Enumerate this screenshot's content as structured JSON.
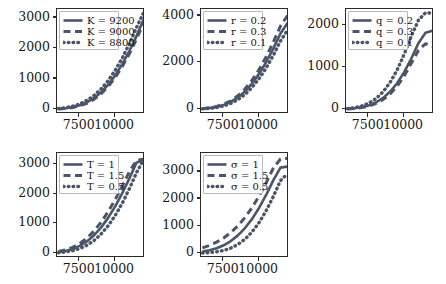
{
  "figure": {
    "background_color": "#ffffff",
    "line_color": "#4a5568",
    "axis_color": "#2a2a2a",
    "legend_border_color": "#b8b8c8",
    "rows": 2,
    "cols": 3
  },
  "chart_data": [
    {
      "type": "line",
      "title": "",
      "xlabel": "",
      "ylabel": "",
      "x": [
        6000,
        6500,
        7000,
        7500,
        8000,
        8500,
        9000,
        9500,
        10000,
        10500,
        11000,
        11500,
        12000
      ],
      "xlim": [
        5900,
        12100
      ],
      "ylim": [
        -150,
        3300
      ],
      "xticks": [
        7500,
        10000
      ],
      "xtick_labels": [
        "7500",
        "10000"
      ],
      "yticks": [
        0,
        1000,
        2000,
        3000
      ],
      "ytick_labels": [
        "0",
        "1000",
        "2000",
        "3000"
      ],
      "grid": false,
      "legend_position": "upper left",
      "series": [
        {
          "name": "K = 9200",
          "style": "solid",
          "values": [
            20,
            40,
            75,
            135,
            230,
            370,
            560,
            810,
            1120,
            1490,
            1920,
            2410,
            2950
          ]
        },
        {
          "name": "K = 9000",
          "style": "dashed",
          "values": [
            15,
            32,
            62,
            115,
            200,
            330,
            510,
            750,
            1050,
            1410,
            1830,
            2310,
            2840
          ]
        },
        {
          "name": "K = 8800",
          "style": "dotted",
          "values": [
            30,
            58,
            105,
            180,
            295,
            455,
            670,
            945,
            1285,
            1690,
            2160,
            2690,
            3180
          ]
        }
      ]
    },
    {
      "type": "line",
      "title": "",
      "xlabel": "",
      "ylabel": "",
      "x": [
        6000,
        6500,
        7000,
        7500,
        8000,
        8500,
        9000,
        9500,
        10000,
        10500,
        11000,
        11500,
        12000
      ],
      "xlim": [
        5900,
        12100
      ],
      "ylim": [
        -200,
        4300
      ],
      "xticks": [
        7500,
        10000
      ],
      "xtick_labels": [
        "7500",
        "10000"
      ],
      "yticks": [
        0,
        2000,
        4000
      ],
      "ytick_labels": [
        "0",
        "2000",
        "4000"
      ],
      "grid": false,
      "legend_position": "upper left",
      "series": [
        {
          "name": "r = 0.2",
          "style": "solid",
          "values": [
            25,
            55,
            105,
            190,
            320,
            510,
            770,
            1110,
            1530,
            2030,
            2610,
            3250,
            3700
          ]
        },
        {
          "name": "r = 0.3",
          "style": "dashed",
          "values": [
            30,
            65,
            125,
            220,
            365,
            580,
            870,
            1250,
            1710,
            2260,
            2890,
            3570,
            4020
          ]
        },
        {
          "name": "r = 0.1",
          "style": "dotted",
          "values": [
            18,
            40,
            80,
            148,
            255,
            415,
            640,
            940,
            1320,
            1780,
            2320,
            2930,
            3400
          ]
        }
      ]
    },
    {
      "type": "line",
      "title": "",
      "xlabel": "",
      "ylabel": "",
      "x": [
        6000,
        6500,
        7000,
        7500,
        8000,
        8500,
        9000,
        9500,
        10000,
        10500,
        11000,
        11500,
        12000
      ],
      "xlim": [
        5900,
        12100
      ],
      "ylim": [
        -110,
        2400
      ],
      "xticks": [
        7500,
        10000
      ],
      "xtick_labels": [
        "7500",
        "10000"
      ],
      "yticks": [
        0,
        1000,
        2000
      ],
      "ytick_labels": [
        "0",
        "1000",
        "2000"
      ],
      "grid": false,
      "legend_position": "upper left",
      "series": [
        {
          "name": "q = 0.2",
          "style": "solid",
          "values": [
            12,
            26,
            52,
            95,
            165,
            270,
            420,
            625,
            890,
            1215,
            1580,
            1830,
            1880
          ]
        },
        {
          "name": "q = 0.3",
          "style": "dashed",
          "values": [
            10,
            22,
            44,
            80,
            140,
            232,
            366,
            552,
            800,
            1105,
            1410,
            1570,
            1510
          ]
        },
        {
          "name": "q = 0.1",
          "style": "dotted",
          "values": [
            18,
            40,
            80,
            148,
            255,
            415,
            640,
            940,
            1320,
            1750,
            2130,
            2310,
            2300
          ]
        }
      ]
    },
    {
      "type": "line",
      "title": "",
      "xlabel": "",
      "ylabel": "",
      "x": [
        6000,
        6500,
        7000,
        7500,
        8000,
        8500,
        9000,
        9500,
        10000,
        10500,
        11000,
        11500,
        12000
      ],
      "xlim": [
        5900,
        12100
      ],
      "ylim": [
        -160,
        3400
      ],
      "xticks": [
        7500,
        10000
      ],
      "xtick_labels": [
        "7500",
        "10000"
      ],
      "yticks": [
        0,
        1000,
        2000,
        3000
      ],
      "ytick_labels": [
        "0",
        "1000",
        "2000",
        "3000"
      ],
      "grid": false,
      "legend_position": "upper left",
      "series": [
        {
          "name": "T = 1",
          "style": "solid",
          "values": [
            40,
            80,
            145,
            250,
            400,
            605,
            870,
            1200,
            1590,
            2040,
            2540,
            3070,
            3180
          ]
        },
        {
          "name": "T = 1.5",
          "style": "dashed",
          "values": [
            60,
            115,
            200,
            330,
            510,
            750,
            1050,
            1410,
            1820,
            2280,
            2770,
            3150,
            3190
          ]
        },
        {
          "name": "T = 0.5",
          "style": "dotted",
          "values": [
            20,
            45,
            88,
            160,
            270,
            430,
            650,
            930,
            1280,
            1700,
            2190,
            2730,
            3180
          ]
        }
      ]
    },
    {
      "type": "line",
      "title": "",
      "xlabel": "",
      "ylabel": "",
      "x": [
        6000,
        6500,
        7000,
        7500,
        8000,
        8500,
        9000,
        9500,
        10000,
        10500,
        11000,
        11500,
        12000
      ],
      "xlim": [
        5900,
        12100
      ],
      "ylim": [
        -175,
        3700
      ],
      "xticks": [
        7500,
        10000
      ],
      "xtick_labels": [
        "7500",
        "10000"
      ],
      "yticks": [
        0,
        1000,
        2000,
        3000
      ],
      "ytick_labels": [
        "0",
        "1000",
        "2000",
        "3000"
      ],
      "grid": false,
      "legend_position": "upper left",
      "series": [
        {
          "name": "σ = 1",
          "style": "solid",
          "values": [
            60,
            110,
            185,
            295,
            450,
            660,
            930,
            1270,
            1680,
            2160,
            2700,
            3160,
            3200
          ]
        },
        {
          "name": "σ = 1.5",
          "style": "dashed",
          "values": [
            200,
            290,
            410,
            565,
            765,
            1015,
            1320,
            1690,
            2120,
            2610,
            3150,
            3480,
            3500
          ]
        },
        {
          "name": "σ = 0.5",
          "style": "dotted",
          "values": [
            10,
            25,
            55,
            105,
            190,
            325,
            520,
            790,
            1140,
            1580,
            2100,
            2680,
            2940
          ]
        }
      ]
    }
  ]
}
